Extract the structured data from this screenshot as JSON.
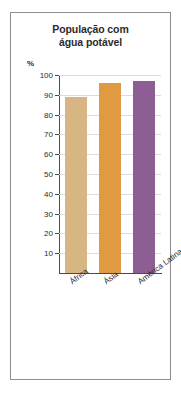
{
  "figure": {
    "title_line1": "População com",
    "title_line2": "água potável",
    "unit_label": "%",
    "border_color": "#8e8e8e",
    "title_color": "#2b2b2b",
    "axis_color": "#4a4a4a",
    "grid_color": "#dcdcdc"
  },
  "chart_data": {
    "type": "bar",
    "title": "População com água potável",
    "xlabel": "",
    "ylabel": "%",
    "ylim": [
      0,
      100
    ],
    "grid": true,
    "legend": "none",
    "categories": [
      "África",
      "Ásia",
      "América Latina e Caribe"
    ],
    "values": [
      89,
      96,
      97
    ],
    "colors": [
      "#d8b684",
      "#e09a42",
      "#8d5e94"
    ],
    "yticks": [
      10,
      20,
      30,
      40,
      50,
      60,
      70,
      80,
      90,
      100
    ],
    "ytick_labels": [
      "10",
      "20",
      "30",
      "40",
      "50",
      "60",
      "70",
      "80",
      "90",
      "100"
    ]
  }
}
